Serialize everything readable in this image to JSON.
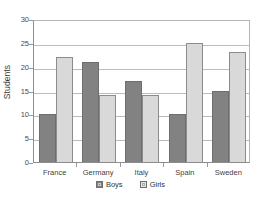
{
  "chart_data": {
    "type": "bar",
    "title": "",
    "xlabel": "",
    "ylabel": "Students",
    "categories": [
      "France",
      "Germany",
      "Italy",
      "Spain",
      "Sweden"
    ],
    "series": [
      {
        "name": "Boys",
        "values": [
          10,
          21,
          17,
          10,
          15
        ],
        "color": "#828282"
      },
      {
        "name": "Girls",
        "values": [
          22,
          14,
          14,
          25,
          23
        ],
        "color": "#d9d9d9"
      }
    ],
    "ylim": [
      0,
      30
    ],
    "yticks": [
      0,
      5,
      10,
      15,
      20,
      25,
      30
    ],
    "ytick_labels": [
      "0",
      "5",
      "10",
      "15",
      "20",
      "25",
      "30"
    ],
    "grid": true,
    "grid_axis": "y",
    "legend_position": "bottom"
  },
  "axes": {
    "y_title": "Students"
  },
  "legend": {
    "items": [
      {
        "label": "Boys",
        "swatch": "dark-gray-swatch"
      },
      {
        "label": "Girls",
        "swatch": "light-gray-swatch"
      }
    ]
  }
}
